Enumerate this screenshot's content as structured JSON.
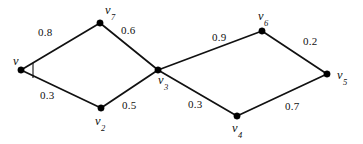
{
  "figure": {
    "background_color": "#ffffff",
    "stroke_color": "#111111",
    "node_color": "#000000",
    "width": 363,
    "height": 144
  },
  "nodes": [
    {
      "id": "v1",
      "label": "v",
      "subscript": "",
      "x": 21,
      "y": 70,
      "label_x": 13,
      "label_y": 55
    },
    {
      "id": "v7",
      "label": "v",
      "subscript": "7",
      "x": 100,
      "y": 23,
      "label_x": 105,
      "label_y": 4
    },
    {
      "id": "v2",
      "label": "v",
      "subscript": "2",
      "x": 101,
      "y": 108,
      "label_x": 95,
      "label_y": 115
    },
    {
      "id": "v3",
      "label": "v",
      "subscript": "3",
      "x": 158,
      "y": 70,
      "label_x": 158,
      "label_y": 74
    },
    {
      "id": "v6",
      "label": "v",
      "subscript": "6",
      "x": 262,
      "y": 31,
      "label_x": 258,
      "label_y": 10
    },
    {
      "id": "v4",
      "label": "v",
      "subscript": "4",
      "x": 237,
      "y": 116,
      "label_x": 232,
      "label_y": 122
    },
    {
      "id": "v5",
      "label": "v",
      "subscript": "5",
      "x": 327,
      "y": 74,
      "label_x": 337,
      "label_y": 69
    }
  ],
  "edges": [
    {
      "id": "e-v1-v7",
      "from": "v1",
      "to": "v7",
      "weight": "0.8",
      "label_x": 38,
      "label_y": 27
    },
    {
      "id": "e-v7-v3",
      "from": "v7",
      "to": "v3",
      "weight": "0.6",
      "label_x": 121,
      "label_y": 25
    },
    {
      "id": "e-v1-v2",
      "from": "v1",
      "to": "v2",
      "weight": "0.3",
      "label_x": 40,
      "label_y": 90
    },
    {
      "id": "e-v2-v3",
      "from": "v2",
      "to": "v3",
      "weight": "0.5",
      "label_x": 122,
      "label_y": 100
    },
    {
      "id": "e-v3-v6",
      "from": "v3",
      "to": "v6",
      "weight": "0.9",
      "label_x": 212,
      "label_y": 32
    },
    {
      "id": "e-v6-v5",
      "from": "v6",
      "to": "v5",
      "weight": "0.2",
      "label_x": 303,
      "label_y": 36
    },
    {
      "id": "e-v3-v4",
      "from": "v3",
      "to": "v4",
      "weight": "0.3",
      "label_x": 188,
      "label_y": 99
    },
    {
      "id": "e-v4-v5",
      "from": "v4",
      "to": "v5",
      "weight": "0.7",
      "label_x": 285,
      "label_y": 101
    }
  ],
  "chart_data": {
    "type": "diagram",
    "subtype": "weighted-undirected-graph",
    "title": "",
    "vertices": [
      "v",
      "v2",
      "v3",
      "v4",
      "v5",
      "v6",
      "v7"
    ],
    "edge_list": [
      {
        "endpoints": [
          "v",
          "v7"
        ],
        "weight": 0.8
      },
      {
        "endpoints": [
          "v7",
          "v3"
        ],
        "weight": 0.6
      },
      {
        "endpoints": [
          "v",
          "v2"
        ],
        "weight": 0.3
      },
      {
        "endpoints": [
          "v2",
          "v3"
        ],
        "weight": 0.5
      },
      {
        "endpoints": [
          "v3",
          "v6"
        ],
        "weight": 0.9
      },
      {
        "endpoints": [
          "v6",
          "v5"
        ],
        "weight": 0.2
      },
      {
        "endpoints": [
          "v3",
          "v4"
        ],
        "weight": 0.3
      },
      {
        "endpoints": [
          "v4",
          "v5"
        ],
        "weight": 0.7
      }
    ],
    "edge_count": 8,
    "vertex_count": 7,
    "directed": false,
    "legend": [],
    "annotations": [
      {
        "name": "angle-mark",
        "at": "v",
        "description": "small angle arc between the two edges leaving vertex v"
      }
    ]
  }
}
